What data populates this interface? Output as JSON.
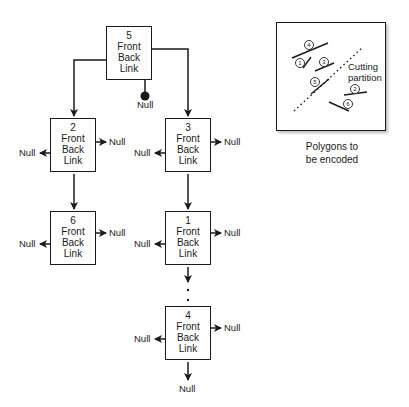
{
  "diagram": {
    "type": "bsp-tree-linked-list",
    "nodes": [
      {
        "id": "5",
        "fields": [
          "Front",
          "Back",
          "Link"
        ]
      },
      {
        "id": "2",
        "fields": [
          "Front",
          "Back",
          "Link"
        ]
      },
      {
        "id": "3",
        "fields": [
          "Front",
          "Back",
          "Link"
        ]
      },
      {
        "id": "6",
        "fields": [
          "Front",
          "Back",
          "Link"
        ]
      },
      {
        "id": "1",
        "fields": [
          "Front",
          "Back",
          "Link"
        ]
      },
      {
        "id": "4",
        "fields": [
          "Front",
          "Back",
          "Link"
        ]
      }
    ],
    "edges": [
      {
        "from": "5",
        "field": "Back",
        "to": "2"
      },
      {
        "from": "5",
        "field": "Front",
        "to": "3"
      },
      {
        "from": "5",
        "field": "Link",
        "to": "Null"
      },
      {
        "from": "2",
        "field": "Front",
        "to": "Null"
      },
      {
        "from": "2",
        "field": "Back",
        "to": "Null"
      },
      {
        "from": "2",
        "field": "Link",
        "to": "6"
      },
      {
        "from": "3",
        "field": "Front",
        "to": "Null"
      },
      {
        "from": "3",
        "field": "Back",
        "to": "Null"
      },
      {
        "from": "3",
        "field": "Link",
        "to": "1"
      },
      {
        "from": "6",
        "field": "Front",
        "to": "Null"
      },
      {
        "from": "6",
        "field": "Back",
        "to": "Null"
      },
      {
        "from": "1",
        "field": "Front",
        "to": "Null"
      },
      {
        "from": "1",
        "field": "Back",
        "to": "Null"
      },
      {
        "from": "1",
        "field": "Link",
        "to": "..."
      },
      {
        "from": "4",
        "field": "Front",
        "to": "Null"
      },
      {
        "from": "4",
        "field": "Back",
        "to": "Null"
      },
      {
        "from": "4",
        "field": "Link",
        "to": "Null"
      }
    ],
    "null_label": "Null"
  },
  "inset": {
    "polygon_labels": [
      "4",
      "1",
      "3",
      "5",
      "2",
      "6"
    ],
    "partition_label_line1": "Cutting",
    "partition_label_line2": "partition",
    "caption_line1": "Polygons to",
    "caption_line2": "be encoded"
  }
}
